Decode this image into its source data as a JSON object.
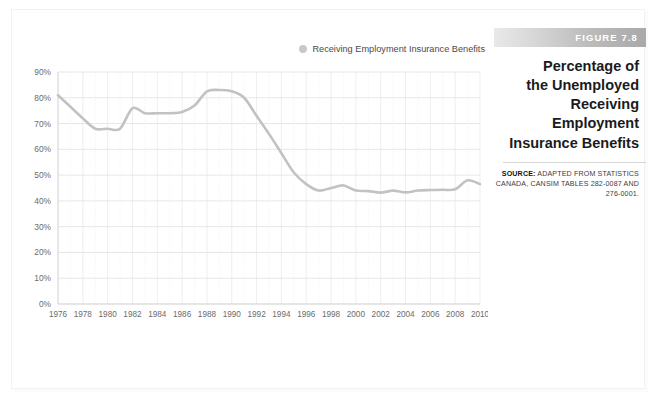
{
  "figure": {
    "badge_label": "FIGURE 7.8",
    "title_lines": [
      "Percentage of",
      "the Unemployed",
      "Receiving Employment",
      "Insurance Benefits"
    ],
    "title_text": "Percentage of the Unemployed Receiving Employment Insurance Benefits",
    "source_lead": "SOURCE:",
    "source_text": " ADAPTED FROM STATISTICS CANADA, CANSIM TABLES 282-0087 AND 276-0001."
  },
  "colors": {
    "series_line": "#c2c2c2",
    "legend_swatch": "#c9c9c9",
    "gridline": "#dcdcdc",
    "badge_text": "#ffffff",
    "title_text": "#1b1b1b",
    "tick_text": "#6b6b6b",
    "background": "#ffffff"
  },
  "chart_data": {
    "type": "line",
    "title": "Percentage of the Unemployed Receiving Employment Insurance Benefits",
    "xlabel": "",
    "ylabel": "",
    "legend_position": "top-right",
    "grid": true,
    "xlim": [
      1976,
      2010
    ],
    "ylim": [
      0,
      90
    ],
    "ytick_labels": [
      "0%",
      "10%",
      "20%",
      "30%",
      "40%",
      "50%",
      "60%",
      "70%",
      "80%",
      "90%"
    ],
    "ytick_values": [
      0,
      10,
      20,
      30,
      40,
      50,
      60,
      70,
      80,
      90
    ],
    "xtick_labels": [
      "1976",
      "1978",
      "1980",
      "1982",
      "1984",
      "1986",
      "1988",
      "1990",
      "1992",
      "1994",
      "1996",
      "1998",
      "2000",
      "2002",
      "2004",
      "2006",
      "2008",
      "2010"
    ],
    "xtick_values": [
      1976,
      1978,
      1980,
      1982,
      1984,
      1986,
      1988,
      1990,
      1992,
      1994,
      1996,
      1998,
      2000,
      2002,
      2004,
      2006,
      2008,
      2010
    ],
    "series": [
      {
        "name": "Receiving Employment Insurance Benefits",
        "x": [
          1976,
          1977,
          1978,
          1979,
          1980,
          1981,
          1982,
          1983,
          1984,
          1985,
          1986,
          1987,
          1988,
          1989,
          1990,
          1991,
          1992,
          1993,
          1994,
          1995,
          1996,
          1997,
          1998,
          1999,
          2000,
          2001,
          2002,
          2003,
          2004,
          2005,
          2006,
          2007,
          2008,
          2009,
          2010
        ],
        "values": [
          81.0,
          76.5,
          72.0,
          68.0,
          68.0,
          68.0,
          76.0,
          74.0,
          74.0,
          74.0,
          74.5,
          77.0,
          82.5,
          83.0,
          82.5,
          80.0,
          73.0,
          66.0,
          58.5,
          51.0,
          46.5,
          44.0,
          45.0,
          46.0,
          44.0,
          43.8,
          43.2,
          44.0,
          43.3,
          44.0,
          44.2,
          44.3,
          44.5,
          48.0,
          46.5
        ]
      }
    ]
  },
  "legend": {
    "label": "Receiving Employment Insurance Benefits",
    "marker": "circle-marker"
  }
}
